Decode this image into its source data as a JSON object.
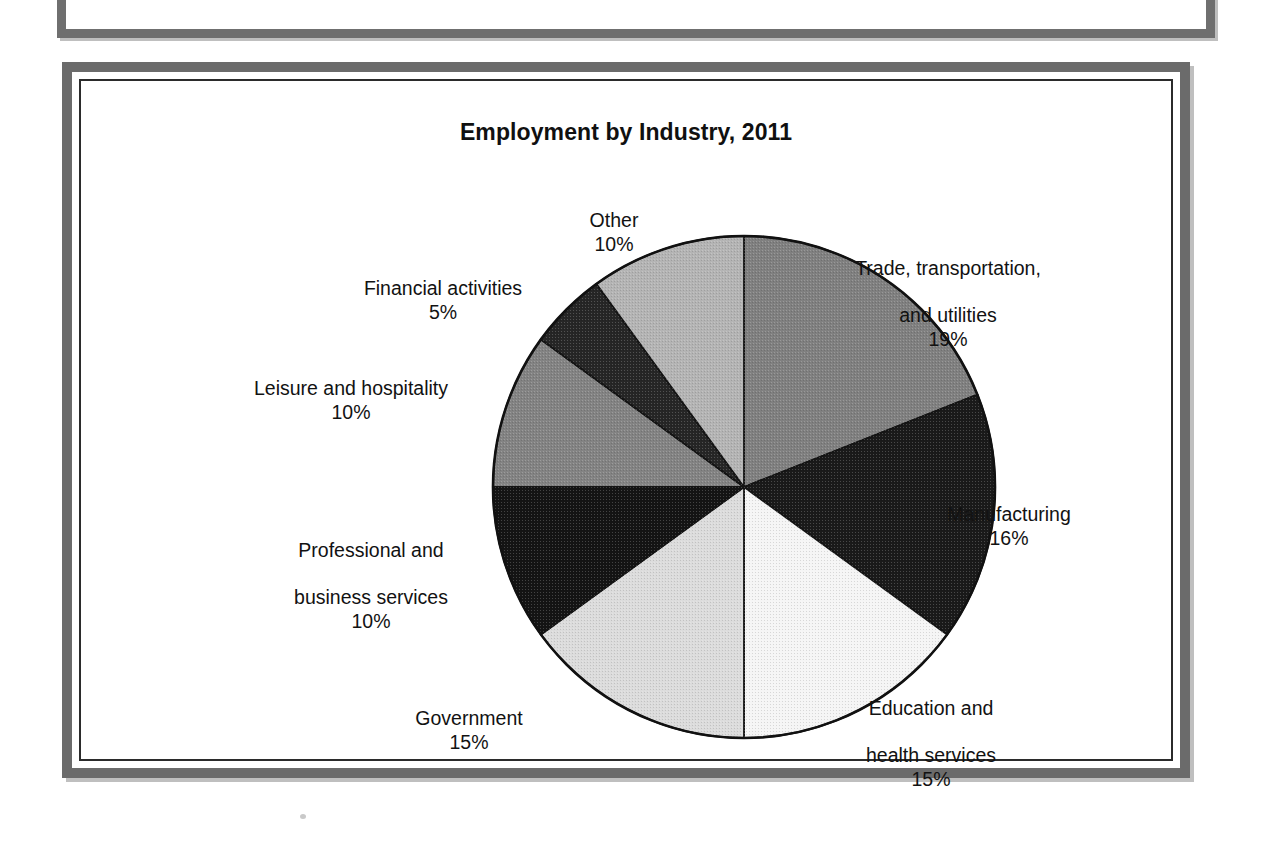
{
  "page": {
    "background": "#ffffff",
    "frame_color": "#6b6b6b",
    "inner_border_color": "#2b2b2b"
  },
  "chart_data": {
    "type": "pie",
    "title": "Employment by Industry, 2011",
    "start_angle_deg": 0,
    "direction": "clockwise",
    "labels_show_percent": true,
    "legend": "none (labels placed around pie)",
    "categories": [
      "Trade, transportation, and utilities",
      "Manufacturing",
      "Education and health services",
      "Government",
      "Professional and business services",
      "Leisure and hospitality",
      "Financial activities",
      "Other"
    ],
    "values": [
      19,
      16,
      15,
      15,
      10,
      10,
      5,
      10
    ],
    "total": 100,
    "unit": "%",
    "slices": [
      {
        "name": "Trade, transportation, and utilities",
        "label_line1": "Trade, transportation,",
        "label_line2": "and utilities",
        "percent_text": "19%",
        "value": 19,
        "color": "#808080"
      },
      {
        "name": "Manufacturing",
        "label_line1": "Manufacturing",
        "label_line2": "",
        "percent_text": "16%",
        "value": 16,
        "color": "#1a1a1a"
      },
      {
        "name": "Education and health services",
        "label_line1": "Education and",
        "label_line2": "health services",
        "percent_text": "15%",
        "value": 15,
        "color": "#f5f5f5"
      },
      {
        "name": "Government",
        "label_line1": "Government",
        "label_line2": "",
        "percent_text": "15%",
        "value": 15,
        "color": "#dcdcdc"
      },
      {
        "name": "Professional and business services",
        "label_line1": "Professional and",
        "label_line2": "business services",
        "percent_text": "10%",
        "value": 10,
        "color": "#141414"
      },
      {
        "name": "Leisure and hospitality",
        "label_line1": "Leisure and hospitality",
        "label_line2": "",
        "percent_text": "10%",
        "value": 10,
        "color": "#838383"
      },
      {
        "name": "Financial activities",
        "label_line1": "Financial activities",
        "label_line2": "",
        "percent_text": "5%",
        "value": 5,
        "color": "#262626"
      },
      {
        "name": "Other",
        "label_line1": "Other",
        "label_line2": "",
        "percent_text": "10%",
        "value": 10,
        "color": "#b4b4b4"
      }
    ]
  }
}
